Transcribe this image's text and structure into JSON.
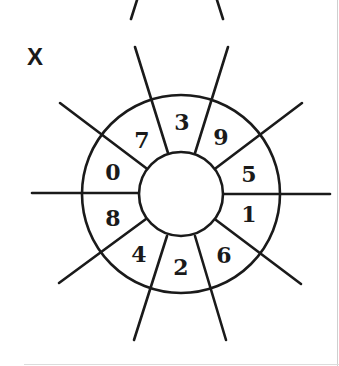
{
  "figure": {
    "label": "X",
    "type": "number wheel",
    "line_color": "#1a1a1a",
    "center": [
      181,
      194
    ],
    "inner_radius": 42,
    "outer_radius": 99,
    "sectors": [
      {
        "value": "7",
        "x": 142,
        "y": 148
      },
      {
        "value": "3",
        "x": 182,
        "y": 130
      },
      {
        "value": "9",
        "x": 221,
        "y": 145
      },
      {
        "value": "0",
        "x": 113,
        "y": 180
      },
      {
        "value": "5",
        "x": 249,
        "y": 182
      },
      {
        "value": "8",
        "x": 113,
        "y": 226
      },
      {
        "value": "1",
        "x": 249,
        "y": 222
      },
      {
        "value": "4",
        "x": 139,
        "y": 262
      },
      {
        "value": "2",
        "x": 181,
        "y": 275
      },
      {
        "value": "6",
        "x": 224,
        "y": 263
      }
    ]
  },
  "previous_figure_fragment": {
    "visible": true
  }
}
